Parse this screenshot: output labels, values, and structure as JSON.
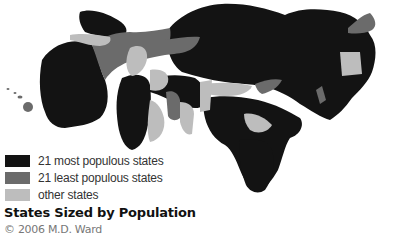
{
  "map": {
    "title": "States Sized by Population",
    "credit": "© 2006 M.D. Ward",
    "colors": {
      "most_populous": "#131313",
      "least_populous": "#6b6b6b",
      "other": "#bdbdbd",
      "background": "#ffffff"
    }
  },
  "legend": {
    "items": [
      {
        "label": "21 most populous states",
        "color": "#131313"
      },
      {
        "label": "21 least populous states",
        "color": "#6b6b6b"
      },
      {
        "label": "other states",
        "color": "#bdbdbd"
      }
    ]
  }
}
